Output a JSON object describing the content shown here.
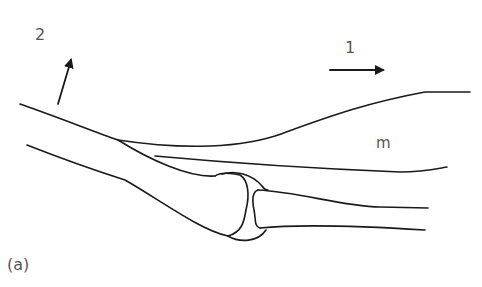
{
  "figure": {
    "panel_label": "(a)",
    "labels": {
      "arrow_1": "1",
      "arrow_2": "2",
      "muscle": "m"
    },
    "arrows": [
      {
        "id": "arrow_1",
        "direction": "right"
      },
      {
        "id": "arrow_2",
        "direction": "up-right"
      }
    ],
    "colors": {
      "stroke": "#1a1a1a",
      "label": "#555555",
      "background": "#ffffff"
    }
  }
}
